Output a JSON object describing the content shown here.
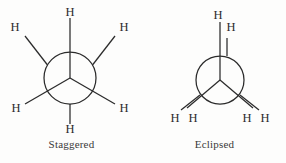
{
  "figure": {
    "type": "newman-projection-pair",
    "background_color": "#fdfdfc",
    "stroke_color": "#2b2b2b",
    "label_color": "#2b2b2b",
    "caption_color": "#3a3a3a"
  },
  "panels": [
    {
      "id": "staggered",
      "caption": "Staggered",
      "circle": {
        "cx": 70,
        "cy": 78,
        "r": 26
      },
      "front_bonds": [
        {
          "name": "front-bond-top",
          "x1": 70,
          "y1": 78,
          "x2": 70,
          "y2": 18
        },
        {
          "name": "front-bond-lower-left",
          "x1": 70,
          "y1": 78,
          "x2": 25,
          "y2": 104
        },
        {
          "name": "front-bond-lower-right",
          "x1": 70,
          "y1": 78,
          "x2": 115,
          "y2": 104
        }
      ],
      "back_bonds": [
        {
          "name": "back-bond-upper-left",
          "x1": 47.5,
          "y1": 65,
          "x2": 25,
          "y2": 36
        },
        {
          "name": "back-bond-upper-right",
          "x1": 92.5,
          "y1": 65,
          "x2": 115,
          "y2": 36
        },
        {
          "name": "back-bond-bottom",
          "x1": 70,
          "y1": 104,
          "x2": 70,
          "y2": 124
        }
      ],
      "atoms": [
        {
          "name": "hydrogen-top",
          "text": "H",
          "x": 70,
          "y": 12
        },
        {
          "name": "hydrogen-upper-left",
          "text": "H",
          "x": 15,
          "y": 27
        },
        {
          "name": "hydrogen-upper-right",
          "text": "H",
          "x": 124,
          "y": 27
        },
        {
          "name": "hydrogen-lower-left",
          "text": "H",
          "x": 16,
          "y": 108
        },
        {
          "name": "hydrogen-lower-right",
          "text": "H",
          "x": 124,
          "y": 108
        },
        {
          "name": "hydrogen-bottom",
          "text": "H",
          "x": 70,
          "y": 129
        }
      ]
    },
    {
      "id": "eclipsed",
      "caption": "Eclipsed",
      "circle": {
        "cx": 77,
        "cy": 80,
        "r": 24
      },
      "front_bonds": [
        {
          "name": "front-bond-top",
          "x1": 77,
          "y1": 80,
          "x2": 77,
          "y2": 22
        },
        {
          "name": "front-bond-lower-left",
          "x1": 77,
          "y1": 80,
          "x2": 44,
          "y2": 108
        },
        {
          "name": "front-bond-lower-right",
          "x1": 77,
          "y1": 80,
          "x2": 110,
          "y2": 108
        }
      ],
      "back_bonds": [
        {
          "name": "back-bond-top",
          "x1": 84,
          "y1": 56,
          "x2": 84,
          "y2": 38
        },
        {
          "name": "back-bond-lower-left",
          "x1": 57,
          "y1": 95,
          "x2": 38,
          "y2": 110
        },
        {
          "name": "back-bond-lower-right",
          "x1": 97,
          "y1": 95,
          "x2": 116,
          "y2": 110
        }
      ],
      "atoms": [
        {
          "name": "hydrogen-front-top",
          "text": "H",
          "x": 75,
          "y": 15
        },
        {
          "name": "hydrogen-back-top",
          "text": "H",
          "x": 88,
          "y": 27
        },
        {
          "name": "hydrogen-back-lower-left",
          "text": "H",
          "x": 32,
          "y": 118
        },
        {
          "name": "hydrogen-front-lower-left",
          "text": "H",
          "x": 50,
          "y": 118
        },
        {
          "name": "hydrogen-front-lower-right",
          "text": "H",
          "x": 104,
          "y": 118
        },
        {
          "name": "hydrogen-back-lower-right",
          "text": "H",
          "x": 122,
          "y": 118
        }
      ]
    }
  ]
}
